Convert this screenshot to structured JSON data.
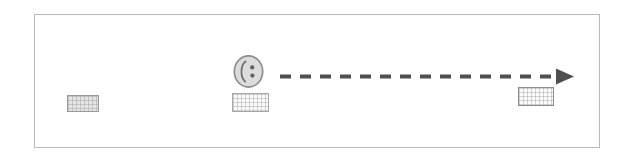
{
  "scene": {
    "title": "Dashed arrow diagram",
    "width": 634,
    "height": 162,
    "background_color": "#ffffff"
  },
  "frame": {
    "label": "diagram-frame",
    "border_color": "#b9b9b9",
    "fill_color": "#ffffff",
    "x": 34,
    "y": 14,
    "width": 566,
    "height": 134
  },
  "figure": {
    "label": "face",
    "outline_color": "#8c8c8c",
    "fill_color": "#dcdcdc",
    "feature_color": "#6e6e6e",
    "x": 233,
    "y": 55,
    "width": 31,
    "height": 33
  },
  "blocks": [
    {
      "name": "left-block",
      "label": "",
      "fill_color": "#e4e4e4",
      "border_color": "#9a9a9a",
      "x": 67,
      "y": 95,
      "width": 32,
      "height": 17
    },
    {
      "name": "center-block",
      "label": "",
      "fill_color": "#fafafa",
      "border_color": "#a8a8a8",
      "x": 232,
      "y": 93,
      "width": 37,
      "height": 19
    },
    {
      "name": "right-block",
      "label": "",
      "fill_color": "#fafafa",
      "border_color": "#8e8e8e",
      "x": 518,
      "y": 87,
      "width": 36,
      "height": 19
    }
  ],
  "arrow": {
    "label": "",
    "direction": "right",
    "style": "dashed",
    "color": "#4f4f4f",
    "stroke_width": 4,
    "dash_length": 11,
    "gap_length": 9,
    "start_x": 280,
    "end_x": 567,
    "y": 76,
    "arrowhead": "solid-triangle"
  }
}
